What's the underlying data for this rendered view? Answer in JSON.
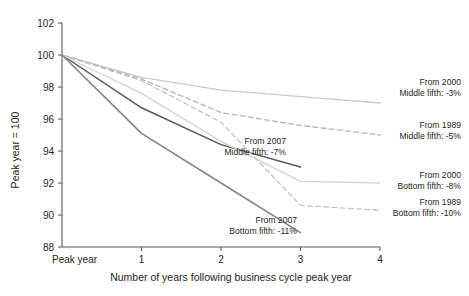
{
  "chart_data": {
    "type": "line",
    "title": "",
    "xlabel": "Number of years following business cycle peak year",
    "ylabel": "Peak year = 100",
    "xlim": [
      0,
      4
    ],
    "ylim": [
      88,
      102
    ],
    "grid": false,
    "legend_position": "right-inline-annotations",
    "x_tick_labels": [
      "Peak year",
      "1",
      "2",
      "3",
      "4"
    ],
    "x_tick_values": [
      0,
      1,
      2,
      3,
      4
    ],
    "y_tick_labels": [
      "88",
      "90",
      "92",
      "94",
      "96",
      "98",
      "100",
      "102"
    ],
    "y_tick_values": [
      88,
      90,
      92,
      94,
      96,
      98,
      100,
      102
    ],
    "series": [
      {
        "name": "From 2000 Middle fifth",
        "label_line1": "From 2000",
        "label_line2": "Middle fifth: -3%",
        "style": "solid",
        "color": "#c9cacb",
        "x": [
          0,
          1,
          2,
          3,
          4
        ],
        "values": [
          100,
          98.6,
          97.8,
          97.4,
          97.0
        ]
      },
      {
        "name": "From 1989 Middle fifth",
        "label_line1": "From 1989",
        "label_line2": "Middle fifth: -5%",
        "style": "dashed",
        "color": "#b3b4b6",
        "x": [
          0,
          1,
          2,
          3,
          4
        ],
        "values": [
          100,
          98.5,
          96.4,
          95.6,
          95.0
        ]
      },
      {
        "name": "From 2007 Middle fifth",
        "label_line1": "From 2007",
        "label_line2": "Middle fifth: -7%",
        "style": "solid",
        "color": "#555759",
        "x": [
          0,
          1,
          2,
          3
        ],
        "values": [
          100,
          96.7,
          94.4,
          93.0
        ]
      },
      {
        "name": "From 2000 Bottom fifth",
        "label_line1": "From 2000",
        "label_line2": "Bottom fifth: -8%",
        "style": "solid",
        "color": "#d3d4d5",
        "x": [
          0,
          1,
          2,
          3,
          4
        ],
        "values": [
          100,
          97.6,
          94.6,
          92.1,
          92.0
        ]
      },
      {
        "name": "From 1989 Bottom fifth",
        "label_line1": "From 1989",
        "label_line2": "Bottom fifth: -10%",
        "style": "dashed",
        "color": "#c2c3c4",
        "x": [
          0,
          1,
          2,
          3,
          4
        ],
        "values": [
          100,
          98.4,
          95.8,
          90.6,
          90.3
        ]
      },
      {
        "name": "From 2007 Bottom fifth",
        "label_line1": "From 2007",
        "label_line2": "Bottom fifth: -11%",
        "style": "solid",
        "color": "#808284",
        "x": [
          0,
          1,
          2,
          3
        ],
        "values": [
          100,
          95.1,
          92.0,
          88.9
        ]
      }
    ],
    "annotations": [
      {
        "id": "ann-2000-middle",
        "line1": "From 2000",
        "line2": "Middle fifth: -3%"
      },
      {
        "id": "ann-1989-middle",
        "line1": "From 1989",
        "line2": "Middle fifth: -5%"
      },
      {
        "id": "ann-2007-middle",
        "line1": "From 2007",
        "line2": "Middle fifth: -7%"
      },
      {
        "id": "ann-2000-bottom",
        "line1": "From 2000",
        "line2": "Bottom fifth: -8%"
      },
      {
        "id": "ann-1989-bottom",
        "line1": "From 1989",
        "line2": "Bottom fifth: -10%"
      },
      {
        "id": "ann-2007-bottom",
        "line1": "From 2007",
        "line2": "Bottom fifth: -11%"
      }
    ]
  }
}
